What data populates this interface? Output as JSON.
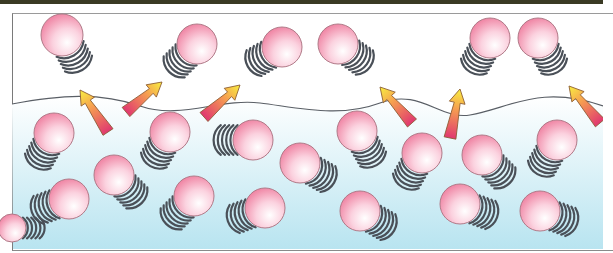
{
  "diagram": {
    "title": "",
    "colors": {
      "top_bar": "#3a3a24",
      "frame_border": "#8a8a8a",
      "vapor_background": "#ffffff",
      "liquid_top": "#ffffff",
      "liquid_bottom": "#b8e4f0",
      "molecule_fill_light": "#ffffff",
      "molecule_fill_dark": "#f07ea0",
      "molecule_stroke": "#b07a88",
      "motion_lines": "#4a5058",
      "surface_line": "#5a5f66",
      "arrow_tip": "#f8f040",
      "arrow_base": "#e03870"
    },
    "vapor_molecules": [
      {
        "cx": 62,
        "cy": 35,
        "r": 21,
        "trail_angle": 60
      },
      {
        "cx": 197,
        "cy": 44,
        "r": 20,
        "trail_angle": 135
      },
      {
        "cx": 282,
        "cy": 47,
        "r": 20,
        "trail_angle": 150
      },
      {
        "cx": 338,
        "cy": 44,
        "r": 20,
        "trail_angle": 35
      },
      {
        "cx": 490,
        "cy": 38,
        "r": 20,
        "trail_angle": 120
      },
      {
        "cx": 538,
        "cy": 38,
        "r": 20,
        "trail_angle": 60
      }
    ],
    "liquid_molecules": [
      {
        "cx": 54,
        "cy": 133,
        "r": 20,
        "trail_angle": 120
      },
      {
        "cx": 170,
        "cy": 132,
        "r": 20,
        "trail_angle": 120
      },
      {
        "cx": 253,
        "cy": 140,
        "r": 20,
        "trail_angle": 180
      },
      {
        "cx": 357,
        "cy": 131,
        "r": 20,
        "trail_angle": 60
      },
      {
        "cx": 422,
        "cy": 153,
        "r": 20,
        "trail_angle": 120
      },
      {
        "cx": 482,
        "cy": 155,
        "r": 20,
        "trail_angle": 45
      },
      {
        "cx": 557,
        "cy": 140,
        "r": 20,
        "trail_angle": 120
      },
      {
        "cx": 114,
        "cy": 175,
        "r": 20,
        "trail_angle": 45
      },
      {
        "cx": 300,
        "cy": 163,
        "r": 20,
        "trail_angle": 30
      },
      {
        "cx": 69,
        "cy": 199,
        "r": 20,
        "trail_angle": 160
      },
      {
        "cx": 194,
        "cy": 196,
        "r": 20,
        "trail_angle": 135
      },
      {
        "cx": 265,
        "cy": 208,
        "r": 20,
        "trail_angle": 160
      },
      {
        "cx": 360,
        "cy": 211,
        "r": 20,
        "trail_angle": 30
      },
      {
        "cx": 460,
        "cy": 204,
        "r": 20,
        "trail_angle": 20
      },
      {
        "cx": 540,
        "cy": 211,
        "r": 20,
        "trail_angle": 20
      },
      {
        "cx": 12,
        "cy": 228,
        "r": 14,
        "trail_angle": 0
      }
    ],
    "arrows": [
      {
        "x1": 108,
        "y1": 132,
        "x2": 80,
        "y2": 90
      },
      {
        "x1": 126,
        "y1": 112,
        "x2": 162,
        "y2": 82
      },
      {
        "x1": 204,
        "y1": 117,
        "x2": 240,
        "y2": 85
      },
      {
        "x1": 412,
        "y1": 123,
        "x2": 380,
        "y2": 87
      },
      {
        "x1": 450,
        "y1": 138,
        "x2": 460,
        "y2": 89
      },
      {
        "x1": 600,
        "y1": 123,
        "x2": 569,
        "y2": 86
      }
    ],
    "surface_path": "M12,104 C60,95 100,92 140,106 C180,120 220,98 260,103 C300,108 340,118 380,103 C420,88 440,120 470,115 C510,108 540,84 603,106"
  }
}
